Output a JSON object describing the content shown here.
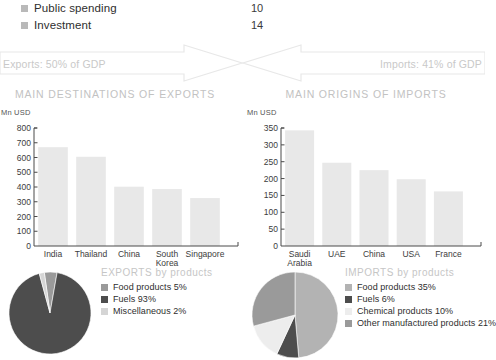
{
  "gdp_components": {
    "rows": [
      {
        "label": "Public spending",
        "value": "10",
        "swatch": "#b9b9b9"
      },
      {
        "label": "Investment",
        "value": "14",
        "swatch": "#b9b9b9"
      }
    ]
  },
  "trade_band": {
    "exports_label": "Exports: 50% of GDP",
    "imports_label": "Imports: 41% of GDP",
    "arrow_color": "#e6e6e6",
    "text_color": "#c9c9c9"
  },
  "panels": {
    "exports": {
      "title": "MAIN DESTINATIONS OF EXPORTS",
      "axis_unit": "Mn USD",
      "pie_title": "EXPORTS by products"
    },
    "imports": {
      "title": "MAIN ORIGINS OF IMPORTS",
      "axis_unit": "Mn USD",
      "pie_title": "IMPORTS by products"
    }
  },
  "chart_data": [
    {
      "type": "bar",
      "id": "main-destinations-of-exports",
      "title": "MAIN DESTINATIONS OF EXPORTS",
      "ylabel": "Mn USD",
      "xlabel": "",
      "categories": [
        "India",
        "Thailand",
        "China",
        "South\nKorea",
        "Singapore"
      ],
      "values": [
        670,
        605,
        402,
        386,
        325
      ],
      "yticks": [
        0,
        100,
        200,
        300,
        400,
        500,
        600,
        700,
        800
      ],
      "ytick_labels": [
        "0",
        "100",
        "200",
        "300",
        "400",
        "500",
        "600",
        "700",
        "800"
      ],
      "ylim": [
        0,
        800
      ],
      "grid": false,
      "bar_color": "#e8e8e8",
      "axis_color": "#4a4a4a"
    },
    {
      "type": "bar",
      "id": "main-origins-of-imports",
      "title": "MAIN ORIGINS OF IMPORTS",
      "ylabel": "Mn USD",
      "xlabel": "",
      "categories": [
        "Saudi\nArabia",
        "UAE",
        "China",
        "USA",
        "France"
      ],
      "values": [
        343,
        247,
        225,
        198,
        162
      ],
      "yticks": [
        0,
        50,
        100,
        150,
        200,
        250,
        300,
        350
      ],
      "ytick_labels": [
        "0",
        "50",
        "100",
        "150",
        "200",
        "250",
        "300",
        "350"
      ],
      "ylim": [
        0,
        350
      ],
      "grid": false,
      "bar_color": "#e8e8e8",
      "axis_color": "#4a4a4a"
    },
    {
      "type": "pie",
      "id": "exports-by-products",
      "title": "EXPORTS by products",
      "labels": [
        "Food products",
        "Fuels",
        "Miscellaneous"
      ],
      "values": [
        5,
        93,
        2
      ],
      "value_labels": [
        "Food products 5%",
        "Fuels 93%",
        "Miscellaneous 2%"
      ],
      "colors": [
        "#9a9a9a",
        "#4d4d4d",
        "#d5d5d5"
      ],
      "legend_position": "right"
    },
    {
      "type": "pie",
      "id": "imports-by-products",
      "title": "IMPORTS by products",
      "labels": [
        "Food products",
        "Fuels",
        "Chemical products",
        "Other manufactured products"
      ],
      "values": [
        35,
        6,
        10,
        21
      ],
      "value_labels": [
        "Food products 35%",
        "Fuels 6%",
        "Chemical products 10%",
        "Other manufactured products 21%"
      ],
      "colors": [
        "#b3b3b3",
        "#4d4d4d",
        "#ededed",
        "#9a9a9a"
      ],
      "legend_position": "right"
    }
  ]
}
